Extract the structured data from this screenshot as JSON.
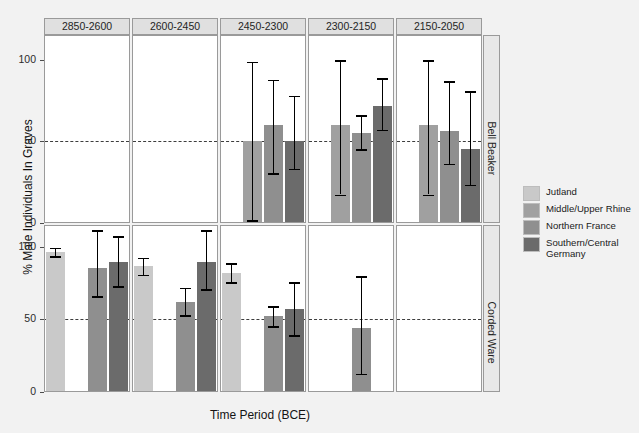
{
  "chart_data": {
    "type": "bar",
    "title": "",
    "xlabel": "Time Period (BCE)",
    "ylabel": "% Male Individuals In Graves",
    "ylim": [
      0,
      115
    ],
    "yticks": [
      0,
      50,
      100
    ],
    "grid": false,
    "legend_position": "right",
    "reference_line": 50,
    "categories": [
      "2850-2600",
      "2600-2450",
      "2450-2300",
      "2300-2150",
      "2150-2050"
    ],
    "row_facets": [
      "Bell Beaker",
      "Corded Ware"
    ],
    "series": [
      {
        "name": "Jutland",
        "color": "#c9c9c9"
      },
      {
        "name": "Middle/Upper Rhine",
        "color": "#a0a0a0"
      },
      {
        "name": "Northern France",
        "color": "#8f8f8f"
      },
      {
        "name": "Southern/Central Germany",
        "color": "#6b6b6b"
      }
    ],
    "panels": [
      {
        "row": "Bell Beaker",
        "category": "2850-2600",
        "bars": []
      },
      {
        "row": "Bell Beaker",
        "category": "2600-2450",
        "bars": []
      },
      {
        "row": "Bell Beaker",
        "category": "2450-2300",
        "bars": [
          {
            "series": "Middle/Upper Rhine",
            "slot": 2,
            "value": 50,
            "low": 1,
            "high": 99
          },
          {
            "series": "Northern France",
            "slot": 3,
            "value": 60,
            "low": 30,
            "high": 88
          },
          {
            "series": "Southern/Central Germany",
            "slot": 4,
            "value": 50,
            "low": 33,
            "high": 78
          }
        ]
      },
      {
        "row": "Bell Beaker",
        "category": "2300-2150",
        "bars": [
          {
            "series": "Middle/Upper Rhine",
            "slot": 2,
            "value": 60,
            "low": 17,
            "high": 100
          },
          {
            "series": "Northern France",
            "slot": 3,
            "value": 55,
            "low": 45,
            "high": 66
          },
          {
            "series": "Southern/Central Germany",
            "slot": 4,
            "value": 72,
            "low": 57,
            "high": 89
          }
        ]
      },
      {
        "row": "Bell Beaker",
        "category": "2150-2050",
        "bars": [
          {
            "series": "Middle/Upper Rhine",
            "slot": 2,
            "value": 60,
            "low": 17,
            "high": 100
          },
          {
            "series": "Northern France",
            "slot": 3,
            "value": 56,
            "low": 36,
            "high": 87
          },
          {
            "series": "Southern/Central Germany",
            "slot": 4,
            "value": 45,
            "low": 23,
            "high": 81
          }
        ]
      },
      {
        "row": "Corded Ware",
        "category": "2850-2600",
        "bars": [
          {
            "series": "Jutland",
            "slot": 1,
            "value": 97,
            "low": 94,
            "high": 100
          },
          {
            "series": "Northern France",
            "slot": 3,
            "value": 86,
            "low": 66,
            "high": 112
          },
          {
            "series": "Southern/Central Germany",
            "slot": 4,
            "value": 90,
            "low": 73,
            "high": 108
          }
        ]
      },
      {
        "row": "Corded Ware",
        "category": "2600-2450",
        "bars": [
          {
            "series": "Jutland",
            "slot": 1,
            "value": 87,
            "low": 81,
            "high": 93
          },
          {
            "series": "Northern France",
            "slot": 3,
            "value": 62,
            "low": 53,
            "high": 72
          },
          {
            "series": "Southern/Central Germany",
            "slot": 4,
            "value": 90,
            "low": 71,
            "high": 112
          }
        ]
      },
      {
        "row": "Corded Ware",
        "category": "2450-2300",
        "bars": [
          {
            "series": "Jutland",
            "slot": 1,
            "value": 82,
            "low": 76,
            "high": 89
          },
          {
            "series": "Northern France",
            "slot": 3,
            "value": 52,
            "low": 45,
            "high": 59
          },
          {
            "series": "Southern/Central Germany",
            "slot": 4,
            "value": 57,
            "low": 39,
            "high": 76
          }
        ]
      },
      {
        "row": "Corded Ware",
        "category": "2300-2150",
        "bars": [
          {
            "series": "Northern France",
            "slot": 3,
            "value": 44,
            "low": 12,
            "high": 80
          }
        ]
      },
      {
        "row": "Corded Ware",
        "category": "2150-2050",
        "bars": []
      }
    ]
  },
  "axis": {
    "ylabel": "% Male Individuals In Graves",
    "xlabel": "Time Period (BCE)",
    "ytick_labels": [
      "0",
      "50",
      "100"
    ]
  },
  "legend": {
    "items": [
      {
        "label": "Jutland",
        "color": "#c9c9c9"
      },
      {
        "label": "Middle/Upper Rhine",
        "color": "#a0a0a0"
      },
      {
        "label": "Northern France",
        "color": "#8f8f8f"
      },
      {
        "label": "Southern/Central Germany",
        "color": "#6b6b6b"
      }
    ]
  },
  "strips": {
    "columns": [
      "2850-2600",
      "2600-2450",
      "2450-2300",
      "2300-2150",
      "2150-2050"
    ],
    "rows": [
      "Bell Beaker",
      "Corded Ware"
    ]
  }
}
